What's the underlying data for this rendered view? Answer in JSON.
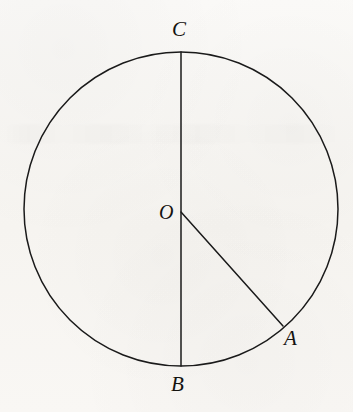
{
  "figure": {
    "kind": "circle-geometry-diagram",
    "width": 353,
    "height": 412,
    "background_color": "#f8f6f3",
    "stroke_color": "#1a1a1a",
    "label_color": "#14120f"
  },
  "circle": {
    "name": "circle-outline",
    "center_x": 181,
    "center_y": 209,
    "radius": 157,
    "stroke_width": 1.5
  },
  "points": {
    "C": {
      "label": "C",
      "x": 181,
      "y": 52,
      "label_x": 172,
      "label_y": 19,
      "font_size": 21
    },
    "O": {
      "label": "O",
      "x": 181,
      "y": 212,
      "label_x": 159,
      "label_y": 202,
      "font_size": 20
    },
    "A": {
      "label": "A",
      "x": 283,
      "y": 326,
      "label_x": 284,
      "label_y": 328,
      "font_size": 21
    },
    "B": {
      "label": "B",
      "x": 181,
      "y": 366,
      "label_x": 171,
      "label_y": 374,
      "font_size": 21
    }
  },
  "segments": [
    {
      "name": "diameter-CB",
      "from": "C",
      "to": "B",
      "x1": 181,
      "y1": 52,
      "x2": 181,
      "y2": 366,
      "stroke_width": 1.5
    },
    {
      "name": "radius-OA",
      "from": "O",
      "to": "A",
      "x1": 181,
      "y1": 212,
      "x2": 283,
      "y2": 326,
      "stroke_width": 1.5
    }
  ],
  "chart_data": {
    "type": "diagram",
    "title": "",
    "shapes": [
      {
        "shape": "circle",
        "center": [
          181,
          209
        ],
        "radius": 157
      },
      {
        "shape": "line",
        "points": [
          [
            181,
            52
          ],
          [
            181,
            366
          ]
        ],
        "label": "CB"
      },
      {
        "shape": "line",
        "points": [
          [
            181,
            212
          ],
          [
            283,
            326
          ]
        ],
        "label": "OA"
      }
    ],
    "labels": [
      "C",
      "O",
      "A",
      "B"
    ]
  }
}
